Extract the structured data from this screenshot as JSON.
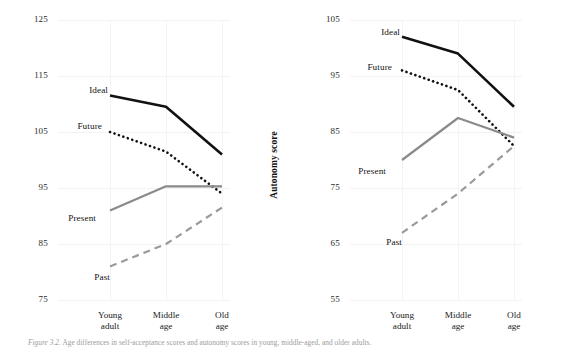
{
  "figure": {
    "caption_lead": "Figure  3.2.",
    "caption_text": "Age  differences  in  self-acceptance  scores  and  autonomy  scores  in  young,  middle-aged,  and  older  adults."
  },
  "colors": {
    "ideal": "#111111",
    "future": "#111111",
    "present": "#8a8a8a",
    "past": "#9a9a9a",
    "grid": "#f2f2f2",
    "text": "#1a1a1a",
    "caption": "#9b9b9b"
  },
  "series_labels": {
    "ideal": "Ideal",
    "future": "Future",
    "present": "Present",
    "past": "Past"
  },
  "chart_data": [
    {
      "type": "line",
      "id": "self-acceptance",
      "title": "",
      "xlabel": "",
      "ylabel": "Self-acceptance score",
      "categories": [
        "Young\nadult",
        "Middle\nage",
        "Old\nage"
      ],
      "category_lines": [
        [
          "Young",
          "adult"
        ],
        [
          "Middle",
          "age"
        ],
        [
          "Old",
          "age"
        ]
      ],
      "ylim": [
        75,
        125
      ],
      "yticks": [
        125,
        115,
        105,
        95,
        85,
        75
      ],
      "grid": true,
      "legend": "inline-labels",
      "series": [
        {
          "name": "Ideal",
          "values": [
            111.5,
            109.5,
            101.0
          ],
          "style": "solid",
          "color": "#111111",
          "width": 2.6
        },
        {
          "name": "Future",
          "values": [
            105.0,
            101.5,
            94.0
          ],
          "style": "dotted",
          "color": "#111111",
          "width": 2.6
        },
        {
          "name": "Present",
          "values": [
            91.0,
            95.3,
            95.3
          ],
          "style": "solid",
          "color": "#8a8a8a",
          "width": 2.2
        },
        {
          "name": "Past",
          "values": [
            81.0,
            85.0,
            91.5
          ],
          "style": "dashed",
          "color": "#9a9a9a",
          "width": 2.2
        }
      ]
    },
    {
      "type": "line",
      "id": "autonomy",
      "title": "",
      "xlabel": "",
      "ylabel": "Autonomy score",
      "categories": [
        "Young\nadult",
        "Middle\nage",
        "Old\nage"
      ],
      "category_lines": [
        [
          "Young",
          "adult"
        ],
        [
          "Middle",
          "age"
        ],
        [
          "Old",
          "age"
        ]
      ],
      "ylim": [
        55,
        105
      ],
      "yticks": [
        105,
        95,
        85,
        75,
        65,
        55
      ],
      "grid": true,
      "legend": "inline-labels",
      "series": [
        {
          "name": "Ideal",
          "values": [
            102.0,
            99.0,
            89.5
          ],
          "style": "solid",
          "color": "#111111",
          "width": 2.6
        },
        {
          "name": "Future",
          "values": [
            96.0,
            92.5,
            82.5
          ],
          "style": "dotted",
          "color": "#111111",
          "width": 2.6
        },
        {
          "name": "Present",
          "values": [
            80.0,
            87.5,
            84.0
          ],
          "style": "solid",
          "color": "#8a8a8a",
          "width": 2.2
        },
        {
          "name": "Past",
          "values": [
            67.0,
            74.0,
            82.5
          ],
          "style": "dashed",
          "color": "#9a9a9a",
          "width": 2.2
        }
      ]
    }
  ]
}
